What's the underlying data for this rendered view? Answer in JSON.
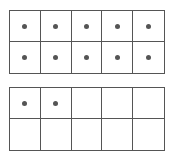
{
  "diagram": {
    "type": "ten-frames",
    "frames": [
      {
        "rows": 2,
        "cols": 5,
        "filled": [
          1,
          1,
          1,
          1,
          1,
          1,
          1,
          1,
          1,
          1
        ],
        "count": 10
      },
      {
        "rows": 2,
        "cols": 5,
        "filled": [
          1,
          1,
          0,
          0,
          0,
          0,
          0,
          0,
          0,
          0
        ],
        "count": 2
      }
    ],
    "total": 12,
    "colors": {
      "line": "#555555",
      "dot": "#555555",
      "background": "#ffffff"
    }
  }
}
